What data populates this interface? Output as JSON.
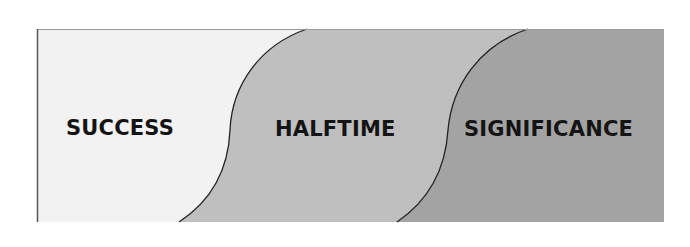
{
  "diagram": {
    "stages": [
      {
        "label": "SUCCESS",
        "fill": "#f2f2f2"
      },
      {
        "label": "HALFTIME",
        "fill": "#bfbfbf"
      },
      {
        "label": "SIGNIFICANCE",
        "fill": "#a3a3a3"
      }
    ],
    "colors": {
      "border": "#555555",
      "curve": "#222222",
      "text": "#141414",
      "background": "#ffffff"
    }
  }
}
